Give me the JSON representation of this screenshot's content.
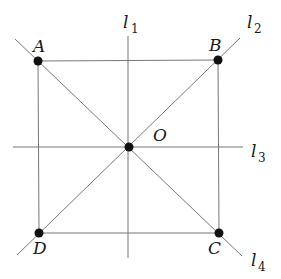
{
  "diagram": {
    "points": [
      {
        "id": "A",
        "label": "A",
        "x": 38,
        "y": 61
      },
      {
        "id": "B",
        "label": "B",
        "x": 218,
        "y": 60
      },
      {
        "id": "C",
        "label": "C",
        "x": 219,
        "y": 233
      },
      {
        "id": "D",
        "label": "D",
        "x": 39,
        "y": 233
      },
      {
        "id": "O",
        "label": "O",
        "x": 129,
        "y": 147
      }
    ],
    "lines": [
      {
        "id": "l1",
        "name": "l",
        "sub": "1",
        "orientation": "vertical"
      },
      {
        "id": "l2",
        "name": "l",
        "sub": "2",
        "orientation": "diagonal through D and B"
      },
      {
        "id": "l3",
        "name": "l",
        "sub": "3",
        "orientation": "horizontal"
      },
      {
        "id": "l4",
        "name": "l",
        "sub": "4",
        "orientation": "diagonal through A and C"
      }
    ],
    "labels": {
      "A": "A",
      "B": "B",
      "C": "C",
      "D": "D",
      "O": "O",
      "l": "l",
      "l1_sub": "1",
      "l2_sub": "2",
      "l3_sub": "3",
      "l4_sub": "4"
    }
  }
}
